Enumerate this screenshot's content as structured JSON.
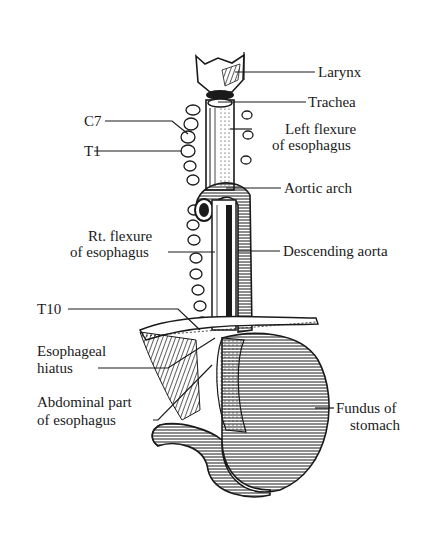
{
  "figure": {
    "labels": {
      "larynx": "Larynx",
      "trachea": "Trachea",
      "c7": "C7",
      "t1": "T1",
      "left_flexure_1": "Left flexure",
      "left_flexure_2": "of esophagus",
      "aortic_arch": "Aortic arch",
      "rt_flexure_1": "Rt. flexure",
      "rt_flexure_2": "of esophagus",
      "descending_aorta": "Descending aorta",
      "t10": "T10",
      "hiatus_1": "Esophageal",
      "hiatus_2": "hiatus",
      "abdominal_1": "Abdominal part",
      "abdominal_2": "of esophagus",
      "fundus_1": "Fundus of",
      "fundus_2": "stomach"
    },
    "colors": {
      "ink": "#1a1a1a",
      "paper": "#ffffff"
    }
  }
}
